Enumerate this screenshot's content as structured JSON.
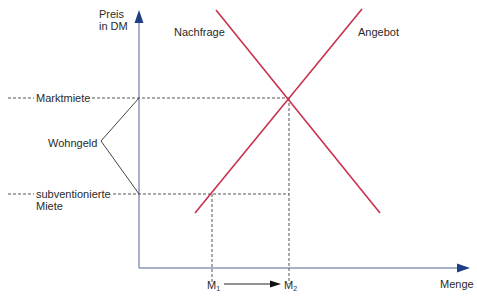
{
  "diagram": {
    "title_cut_off": "",
    "y_axis": {
      "label_line1": "Preis",
      "label_line2": "in DM"
    },
    "x_axis": {
      "label": "Menge"
    },
    "curves": {
      "demand_label": "Nachfrage",
      "supply_label": "Angebot"
    },
    "price_levels": {
      "market_rent": "Marktmiete",
      "subsidized_rent_line1": "subventionierte",
      "subsidized_rent_line2": "Miete"
    },
    "bracket_label": "Wohngeld",
    "quantities": {
      "m1": "M",
      "m1_sub": "1",
      "m2": "M",
      "m2_sub": "2"
    },
    "colors": {
      "axis": "#2b4a8c",
      "axis_line": "#8a97b8",
      "curve": "#c8324b",
      "guide": "#555555",
      "bracket": "#444444"
    }
  }
}
